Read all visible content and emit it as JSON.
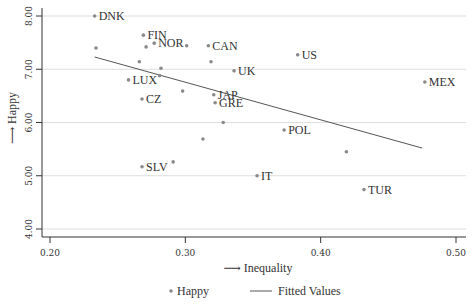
{
  "chart_data": {
    "type": "scatter",
    "title": "",
    "xlabel": "Inequality",
    "ylabel": "Happy",
    "xlim": [
      0.2,
      0.5
    ],
    "ylim": [
      4.0,
      8.0
    ],
    "xticks": [
      0.2,
      0.3,
      0.4,
      0.5
    ],
    "xtick_labels": [
      "0.20",
      "0.30",
      "0.40",
      "0.50"
    ],
    "yticks": [
      4.0,
      5.0,
      6.0,
      7.0,
      8.0
    ],
    "ytick_labels": [
      "4.00",
      "5.00",
      "6.00",
      "7.00",
      "8.00"
    ],
    "grid": "horizontal",
    "axis_arrow": "⟶",
    "colors": {
      "points": "#8a8a8a",
      "line": "#555555",
      "grid": "#dddddd",
      "axis": "#333333",
      "text": "#333333"
    },
    "series": [
      {
        "name": "Happy",
        "kind": "scatter",
        "points": [
          {
            "x": 0.233,
            "y": 8.0,
            "label": "DNK"
          },
          {
            "x": 0.234,
            "y": 7.4,
            "label": ""
          },
          {
            "x": 0.269,
            "y": 7.64,
            "label": "FIN"
          },
          {
            "x": 0.277,
            "y": 7.49,
            "label": "NOR"
          },
          {
            "x": 0.271,
            "y": 7.42,
            "label": ""
          },
          {
            "x": 0.301,
            "y": 7.44,
            "label": ""
          },
          {
            "x": 0.317,
            "y": 7.44,
            "label": "CAN"
          },
          {
            "x": 0.319,
            "y": 7.14,
            "label": ""
          },
          {
            "x": 0.266,
            "y": 7.14,
            "label": ""
          },
          {
            "x": 0.282,
            "y": 7.02,
            "label": ""
          },
          {
            "x": 0.336,
            "y": 6.97,
            "label": "UK"
          },
          {
            "x": 0.281,
            "y": 6.88,
            "label": ""
          },
          {
            "x": 0.258,
            "y": 6.8,
            "label": "LUX"
          },
          {
            "x": 0.383,
            "y": 7.27,
            "label": "US"
          },
          {
            "x": 0.477,
            "y": 6.76,
            "label": "MEX"
          },
          {
            "x": 0.298,
            "y": 6.59,
            "label": ""
          },
          {
            "x": 0.321,
            "y": 6.52,
            "label": "JAP"
          },
          {
            "x": 0.268,
            "y": 6.44,
            "label": "CZ"
          },
          {
            "x": 0.322,
            "y": 6.37,
            "label": "GRE"
          },
          {
            "x": 0.328,
            "y": 6.0,
            "label": ""
          },
          {
            "x": 0.373,
            "y": 5.86,
            "label": "POL"
          },
          {
            "x": 0.313,
            "y": 5.69,
            "label": ""
          },
          {
            "x": 0.419,
            "y": 5.45,
            "label": ""
          },
          {
            "x": 0.291,
            "y": 5.26,
            "label": ""
          },
          {
            "x": 0.268,
            "y": 5.17,
            "label": "SLV"
          },
          {
            "x": 0.353,
            "y": 5.0,
            "label": "IT"
          },
          {
            "x": 0.432,
            "y": 4.74,
            "label": "TUR"
          }
        ]
      },
      {
        "name": "Fitted Values",
        "kind": "line",
        "points": [
          {
            "x": 0.233,
            "y": 7.23
          },
          {
            "x": 0.475,
            "y": 5.52
          }
        ]
      }
    ],
    "legend": {
      "position": "bottom-center",
      "entries": [
        {
          "label": "Happy",
          "symbol": "dot"
        },
        {
          "label": "Fitted Values",
          "symbol": "line"
        }
      ]
    }
  }
}
